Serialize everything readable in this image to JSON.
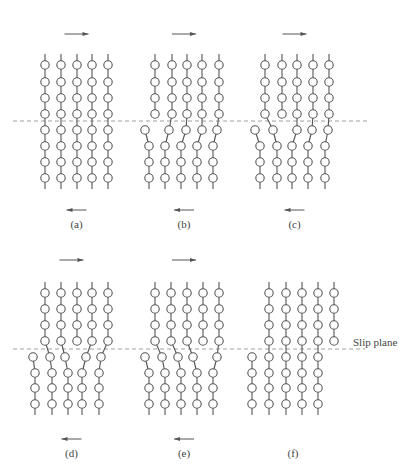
{
  "figure": {
    "slip_plane_label": "Slip plane",
    "colors": {
      "line": "#555555",
      "dash": "#888888",
      "background": "#ffffff"
    },
    "panels": [
      {
        "id": "a",
        "label": "(a)",
        "top_arrow": "right",
        "bottom_arrow": "left",
        "slip_y": 121,
        "rows_upper": [
          65,
          82,
          98,
          114
        ],
        "rows_lower": [
          130,
          146,
          162,
          178
        ],
        "upper_cols": [
          45,
          61,
          77,
          92,
          108
        ],
        "lower_first_row_cols": [
          45,
          61,
          77,
          92,
          108
        ],
        "lower_cols": [
          45,
          61,
          77,
          92,
          108
        ],
        "bonds": [
          [
            0,
            0
          ],
          [
            1,
            1
          ],
          [
            2,
            2
          ],
          [
            3,
            3
          ],
          [
            4,
            4
          ]
        ]
      },
      {
        "id": "b",
        "label": "(b)",
        "top_arrow": "right",
        "bottom_arrow": "left",
        "slip_y": 121,
        "rows_upper": [
          65,
          82,
          98,
          114
        ],
        "rows_lower": [
          130,
          146,
          162,
          178
        ],
        "upper_cols": [
          155,
          172,
          187,
          202,
          219
        ],
        "lower_first_row_cols": [
          145,
          169,
          186,
          202,
          217
        ],
        "lower_cols": [
          149,
          165,
          181,
          197,
          213
        ],
        "bonds": [
          [
            1,
            1
          ],
          [
            2,
            2
          ],
          [
            3,
            3
          ],
          [
            4,
            4
          ]
        ]
      },
      {
        "id": "c",
        "label": "(c)",
        "top_arrow": "right",
        "bottom_arrow": "left",
        "slip_y": 121,
        "rows_upper": [
          65,
          82,
          98,
          114
        ],
        "rows_lower": [
          130,
          146,
          162,
          178
        ],
        "upper_cols": [
          265,
          282,
          297,
          313,
          329
        ],
        "lower_first_row_cols": [
          255,
          273,
          297,
          312,
          328
        ],
        "lower_cols": [
          260,
          277,
          292,
          308,
          325
        ],
        "bonds": [
          [
            0,
            1
          ],
          [
            2,
            2
          ],
          [
            3,
            3
          ],
          [
            4,
            4
          ]
        ]
      },
      {
        "id": "d",
        "label": "(d)",
        "top_arrow": "right",
        "bottom_arrow": "left",
        "slip_y": 349,
        "rows_upper": [
          293,
          309,
          325,
          341
        ],
        "rows_lower": [
          357,
          373,
          388,
          404
        ],
        "upper_cols": [
          45,
          61,
          77,
          92,
          108
        ],
        "lower_first_row_cols": [
          33,
          50,
          65,
          86,
          101
        ],
        "lower_cols": [
          35,
          52,
          68,
          82,
          99
        ],
        "bonds": [
          [
            0,
            1
          ],
          [
            1,
            2
          ],
          [
            3,
            3
          ],
          [
            4,
            4
          ]
        ]
      },
      {
        "id": "e",
        "label": "(e)",
        "top_arrow": "right",
        "bottom_arrow": "left",
        "slip_y": 349,
        "rows_upper": [
          293,
          309,
          325,
          341
        ],
        "rows_lower": [
          357,
          373,
          388,
          404
        ],
        "upper_cols": [
          155,
          171,
          187,
          203,
          219
        ],
        "lower_first_row_cols": [
          145,
          162,
          178,
          193,
          217
        ],
        "lower_cols": [
          149,
          165,
          181,
          197,
          213
        ],
        "bonds": [
          [
            0,
            1
          ],
          [
            1,
            2
          ],
          [
            2,
            3
          ],
          [
            4,
            4
          ]
        ]
      },
      {
        "id": "f",
        "label": "(f)",
        "top_arrow": "none",
        "bottom_arrow": "none",
        "slip_y": 349,
        "rows_upper": [
          293,
          309,
          325,
          341
        ],
        "rows_lower": [
          357,
          373,
          388,
          404
        ],
        "upper_cols": [
          269,
          286,
          302,
          318,
          334
        ],
        "lower_first_row_cols": [
          252,
          269,
          286,
          302,
          318
        ],
        "lower_cols": [
          252,
          269,
          286,
          302,
          318
        ],
        "bonds": [
          [
            0,
            1
          ],
          [
            1,
            2
          ],
          [
            2,
            3
          ],
          [
            3,
            4
          ]
        ]
      }
    ]
  }
}
